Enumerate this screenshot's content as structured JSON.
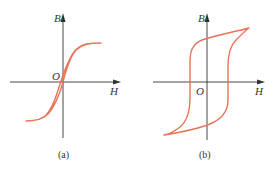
{
  "figure": {
    "curve_color": "#e8745a",
    "axis_color": "#333333",
    "panels": [
      {
        "id": "a",
        "caption": "(a)",
        "x_axis_label": "H",
        "y_axis_label": "B",
        "origin_label": "O",
        "description": "Narrow hysteresis loop (soft magnetic material)"
      },
      {
        "id": "b",
        "caption": "(b)",
        "x_axis_label": "H",
        "y_axis_label": "B",
        "origin_label": "O",
        "description": "Wide hysteresis loop (hard magnetic material)"
      }
    ]
  }
}
